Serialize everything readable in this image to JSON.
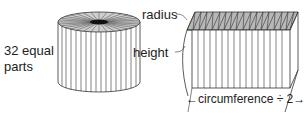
{
  "labels": {
    "parts_line1": "32 equal",
    "parts_line2": "parts",
    "radius": "radius",
    "height": "height",
    "circumference": "←circumference ÷ 2→"
  },
  "diagram": {
    "segments": 32,
    "colors": {
      "stroke": "#333333",
      "top_fill": "#bdbdbd",
      "background": "#ffffff"
    }
  }
}
